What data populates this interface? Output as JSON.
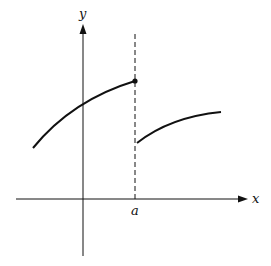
{
  "figure": {
    "axes": {
      "x_label": "x",
      "y_label": "y"
    },
    "marks": {
      "discontinuity_label": "a"
    },
    "colors": {
      "ink": "#111111",
      "background": "#ffffff"
    },
    "elements": {
      "left_branch": "increasing concave-down curve ending at a filled point above x = a",
      "right_branch": "increasing concave-down curve starting (open) just right of x = a at a lower height",
      "vertical_guide": "dashed vertical line at x = a",
      "endpoint": "filled dot at (a, f(a)) on the left branch"
    }
  }
}
